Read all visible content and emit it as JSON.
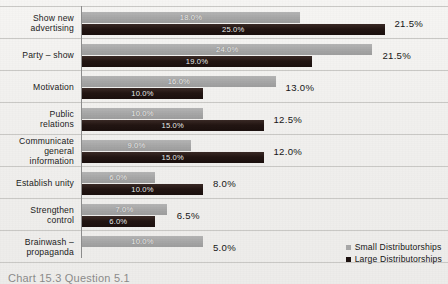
{
  "legend": {
    "position": "bottom-right",
    "entries": [
      {
        "label": "Small Distributorships",
        "color": "#a8a8a8",
        "key": "small"
      },
      {
        "label": "Large Distributorships",
        "color": "#1d1210",
        "key": "large"
      }
    ]
  },
  "caption": {
    "text": "Chart 15.3  Question 5.1"
  },
  "chart_data": {
    "type": "bar",
    "orientation": "horizontal",
    "grouped": true,
    "title": "",
    "subtitle": "",
    "xlabel": "",
    "ylabel": "",
    "xlim": [
      0,
      25
    ],
    "grid": false,
    "legend_position": "bottom-right",
    "value_suffix": "%",
    "categories": [
      "Show new\nadvertising",
      "Party – show",
      "Motivation",
      "Public\nrelations",
      "Communicate\ngeneral\ninformation",
      "Establish unity",
      "Strengthen\ncontrol",
      "Brainwash –\npropaganda"
    ],
    "series": [
      {
        "name": "Small Distributorships",
        "color": "#a8a8a8",
        "values": [
          18.0,
          24.0,
          16.0,
          10.0,
          9.0,
          6.0,
          7.0,
          10.0
        ],
        "labels": [
          "18.0%",
          "24.0%",
          "16.0%",
          "10.0%",
          "9.0%",
          "6.0%",
          "7.0%",
          "10.0%"
        ]
      },
      {
        "name": "Large Distributorships",
        "color": "#1d1210",
        "values": [
          25.0,
          19.0,
          10.0,
          15.0,
          15.0,
          10.0,
          6.0,
          0
        ],
        "labels": [
          "25.0%",
          "19.0%",
          "10.0%",
          "15.0%",
          "15.0%",
          "10.0%",
          "6.0%",
          ""
        ]
      }
    ],
    "totals": [
      "21.5%",
      "21.5%",
      "13.0%",
      "12.5%",
      "12.0%",
      "8.0%",
      "6.5%",
      "5.0%"
    ],
    "rows": [
      {
        "category": "Show new advertising",
        "small": 18.0,
        "large": 25.0,
        "total": "21.5%"
      },
      {
        "category": "Party – show",
        "small": 24.0,
        "large": 19.0,
        "total": "21.5%"
      },
      {
        "category": "Motivation",
        "small": 16.0,
        "large": 10.0,
        "total": "13.0%"
      },
      {
        "category": "Public relations",
        "small": 10.0,
        "large": 15.0,
        "total": "12.5%"
      },
      {
        "category": "Communicate general information",
        "small": 9.0,
        "large": 15.0,
        "total": "12.0%"
      },
      {
        "category": "Establish unity",
        "small": 6.0,
        "large": 10.0,
        "total": "8.0%"
      },
      {
        "category": "Strengthen control",
        "small": 7.0,
        "large": 6.0,
        "total": "6.5%"
      },
      {
        "category": "Brainwash – propaganda",
        "small": 10.0,
        "large": 0,
        "total": "5.0%"
      }
    ]
  }
}
